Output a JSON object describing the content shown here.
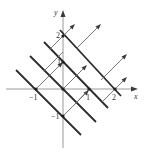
{
  "panel_label": ")",
  "axes": {
    "x_label": "x",
    "y_label": "y",
    "x_ticks": [
      {
        "value": -1,
        "label": "−1"
      },
      {
        "value": 1,
        "label": "1"
      },
      {
        "value": 2,
        "label": "2"
      }
    ],
    "y_ticks": [
      {
        "value": 2,
        "label": "2"
      },
      {
        "value": 1,
        "label": "1"
      },
      {
        "value": -1,
        "label": "−1"
      }
    ]
  },
  "level_lines": {
    "description": "Bold lines x + y = c",
    "c_values": [
      -1,
      0,
      1,
      2
    ]
  },
  "flow_arrows": {
    "description": "Thin arrows in direction (1,1) perpendicular to level lines",
    "direction": [
      1,
      1
    ]
  },
  "colors": {
    "bold_line": "#2a2a2a",
    "thin_arrow": "#6a6a6a",
    "axis": "#9a9a9a"
  }
}
